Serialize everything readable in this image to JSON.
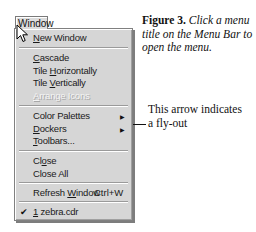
{
  "menu": {
    "title": "Window",
    "items": [
      {
        "pre": "",
        "u": "N",
        "post": "ew Window",
        "top": 31,
        "disabled": false
      },
      {
        "pre": "",
        "u": "C",
        "post": "ascade",
        "top": 51,
        "disabled": false
      },
      {
        "pre": "Tile ",
        "u": "H",
        "post": "orizontally",
        "top": 64,
        "disabled": false
      },
      {
        "pre": "Tile ",
        "u": "V",
        "post": "ertically",
        "top": 76,
        "disabled": false
      },
      {
        "pre": "",
        "u": "A",
        "post": "rrange Icons",
        "top": 89,
        "disabled": true
      },
      {
        "pre": "Color Palettes",
        "u": "",
        "post": "",
        "top": 108,
        "disabled": false,
        "flyout": true
      },
      {
        "pre": "",
        "u": "D",
        "post": "ockers",
        "top": 121,
        "disabled": false,
        "flyout": true
      },
      {
        "pre": "",
        "u": "T",
        "post": "oolbars...",
        "top": 133,
        "disabled": false
      },
      {
        "pre": "Cl",
        "u": "o",
        "post": "se",
        "top": 153,
        "disabled": false
      },
      {
        "pre": "Close All",
        "u": "",
        "post": "",
        "top": 166,
        "disabled": false
      },
      {
        "pre": "Refresh ",
        "u": "W",
        "post": "indow",
        "top": 185,
        "disabled": false,
        "shortcut": "Ctrl+W"
      },
      {
        "pre": "",
        "u": "1",
        "post": " zebra.cdr",
        "top": 205,
        "disabled": false,
        "checked": true
      }
    ],
    "flyout_glyph": "▶",
    "check_glyph": "✔"
  },
  "caption": {
    "label": "Figure 3.",
    "text": "Click a menu title on the Menu Bar to open the menu."
  },
  "callout": {
    "text": "This arrow indicates a fly-out"
  }
}
